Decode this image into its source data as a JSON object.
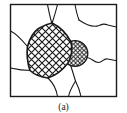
{
  "figure": {
    "label": "(a)",
    "type": "grain-microstructure-schematic",
    "colors": {
      "line": "#1a1a1a",
      "background": "#ffffff"
    },
    "elements": {
      "frame": "rectangular border frame",
      "large_grain": "large cross-hatched grain (coarse hatch)",
      "small_grain": "small circular cross-hatched grain (fine hatch)",
      "boundaries": "surrounding grain-boundary network"
    }
  }
}
